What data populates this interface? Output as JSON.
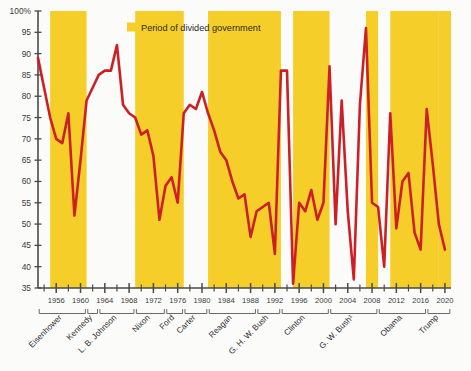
{
  "legend": {
    "swatch_color": "#F5CE2A",
    "label": "Period of divided government"
  },
  "colors": {
    "line": "#CC2026",
    "band": "#F5CE2A",
    "axis": "#4a4a4a",
    "text": "#2e2e2e",
    "background": "#fbfbfa"
  },
  "yaxis": {
    "top_label": "100%",
    "ticks": [
      "100%",
      "95",
      "90",
      "85",
      "80",
      "75",
      "70",
      "65",
      "60",
      "55",
      "50",
      "45",
      "40",
      "35"
    ],
    "min": 35,
    "max": 100,
    "step": 5
  },
  "xaxis": {
    "ticks": [
      "1956",
      "1960",
      "1964",
      "1968",
      "1972",
      "1976",
      "1980",
      "1984",
      "1988",
      "1992",
      "1996",
      "2000",
      "2004",
      "2008",
      "2012",
      "2016",
      "2020"
    ],
    "min": 1953,
    "max": 2021,
    "tick_step_years": 4,
    "minor_tick_step_years": 2
  },
  "presidents": [
    {
      "name": "Eisenhower",
      "start": 1953,
      "end": 1961
    },
    {
      "name": "Kennedy",
      "start": 1961,
      "end": 1963
    },
    {
      "name": "L. B. Johnson",
      "start": 1963,
      "end": 1969
    },
    {
      "name": "Nixon",
      "start": 1969,
      "end": 1974
    },
    {
      "name": "Ford",
      "start": 1974,
      "end": 1977
    },
    {
      "name": "Carter",
      "start": 1977,
      "end": 1981
    },
    {
      "name": "Reagan",
      "start": 1981,
      "end": 1989
    },
    {
      "name": "G. H. W. Bush",
      "start": 1989,
      "end": 1993
    },
    {
      "name": "Clinton",
      "start": 1993,
      "end": 2001
    },
    {
      "name": "G. W. Bush¹",
      "start": 2001,
      "end": 2009
    },
    {
      "name": "Obama",
      "start": 2009,
      "end": 2017
    },
    {
      "name": "Trump",
      "start": 2017,
      "end": 2021
    }
  ],
  "chart_data": {
    "type": "line",
    "title": "",
    "subtitle": "",
    "xlabel": "",
    "ylabel": "",
    "xlim": [
      1953,
      2021
    ],
    "ylim": [
      35,
      100
    ],
    "grid": false,
    "legend_position": "top-center",
    "series": [
      {
        "name": "Percentage",
        "color": "#CC2026",
        "x": [
          1953,
          1954,
          1955,
          1956,
          1957,
          1958,
          1959,
          1960,
          1961,
          1962,
          1963,
          1964,
          1965,
          1966,
          1967,
          1968,
          1969,
          1970,
          1971,
          1972,
          1973,
          1974,
          1975,
          1976,
          1977,
          1978,
          1979,
          1980,
          1981,
          1982,
          1983,
          1984,
          1985,
          1986,
          1987,
          1988,
          1989,
          1990,
          1991,
          1992,
          1993,
          1994,
          1995,
          1996,
          1997,
          1998,
          1999,
          2000,
          2001,
          2002,
          2003,
          2004,
          2005,
          2006,
          2007,
          2008,
          2009,
          2010,
          2011,
          2012,
          2013,
          2014,
          2015,
          2016,
          2017,
          2018,
          2019,
          2020
        ],
        "values": [
          89,
          82,
          75,
          70,
          69,
          76,
          52,
          65,
          79,
          82,
          85,
          86,
          86,
          92,
          78,
          76,
          75,
          71,
          72,
          66,
          51,
          59,
          61,
          55,
          76,
          78,
          77,
          81,
          76,
          72,
          67,
          65,
          60,
          56,
          57,
          47,
          53,
          54,
          55,
          43,
          86,
          86,
          36,
          55,
          53,
          58,
          51,
          55,
          87,
          50,
          79,
          53,
          37,
          78,
          96,
          55,
          54,
          40,
          76,
          49,
          60,
          62,
          48,
          44,
          77,
          64,
          50,
          44
        ]
      }
    ],
    "divided_government_periods": [
      {
        "start": 1955,
        "end": 1961
      },
      {
        "start": 1969,
        "end": 1977
      },
      {
        "start": 1981,
        "end": 1993
      },
      {
        "start": 1995,
        "end": 2001
      },
      {
        "start": 2007,
        "end": 2009
      },
      {
        "start": 2011,
        "end": 2019
      },
      {
        "start": 2019,
        "end": 2021
      }
    ]
  }
}
